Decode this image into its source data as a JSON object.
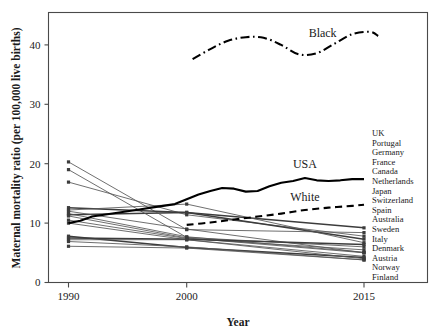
{
  "chart_data": {
    "type": "line",
    "title": "",
    "xlabel": "Year",
    "ylabel": "Maternal mortality ratio (per 100,000 live births)",
    "xlim": [
      1988.5,
      2017.0
    ],
    "ylim": [
      0,
      44.5
    ],
    "xticks": [
      1990,
      2000,
      2015
    ],
    "xticklabels": [
      "1990",
      "2000",
      "2015"
    ],
    "yticks": [
      0,
      10,
      20,
      30,
      40
    ],
    "yticklabels": [
      "0",
      "10",
      "20",
      "30",
      "40"
    ],
    "grid": false,
    "legend_position": "inline-annotations",
    "annotations": [
      {
        "text": "Black",
        "x": 2011.5,
        "y": 41.3
      },
      {
        "text": "USA",
        "x": 2010.0,
        "y": 19.2
      },
      {
        "text": "White",
        "x": 2010.0,
        "y": 13.7
      }
    ],
    "highlight_series": [
      {
        "name": "Black",
        "style": "dash-dot",
        "color": "#000000",
        "x": [
          2000.5,
          2002.0,
          2003.5,
          2005.0,
          2006.5,
          2008.0,
          2009.5,
          2011.0,
          2012.5,
          2014.0,
          2015.5,
          2016.2
        ],
        "y": [
          37.6,
          39.3,
          40.7,
          41.3,
          41.2,
          40.0,
          38.4,
          38.6,
          40.2,
          41.8,
          42.2,
          41.5
        ]
      },
      {
        "name": "USA",
        "style": "solid",
        "color": "#000000",
        "x": [
          1990,
          1991,
          1992,
          1993,
          1994,
          1995,
          1996,
          1997,
          1998,
          1999,
          2000,
          2001,
          2002,
          2003,
          2004,
          2005,
          2006,
          2007,
          2008,
          2009,
          2010,
          2011,
          2012,
          2013,
          2014,
          2015
        ],
        "y": [
          10.0,
          10.4,
          11.1,
          11.4,
          11.7,
          12.0,
          12.3,
          12.6,
          12.9,
          13.2,
          14.0,
          14.8,
          15.4,
          15.9,
          15.8,
          15.3,
          15.4,
          16.2,
          16.8,
          17.1,
          17.6,
          17.2,
          17.1,
          17.2,
          17.4,
          17.4
        ]
      },
      {
        "name": "White",
        "style": "dashed",
        "color": "#000000",
        "x": [
          2000,
          2002,
          2004,
          2006,
          2008,
          2010,
          2012,
          2014,
          2015
        ],
        "y": [
          9.7,
          10.1,
          10.6,
          11.1,
          11.6,
          12.2,
          12.6,
          12.9,
          13.1
        ]
      }
    ],
    "countries": [
      {
        "name": "UK",
        "x": [
          1990,
          2000,
          2015
        ],
        "y": [
          11.4,
          11.8,
          9.2
        ],
        "emphasis": "thick"
      },
      {
        "name": "Portugal",
        "x": [
          1990,
          2000,
          2015
        ],
        "y": [
          20.3,
          8.9,
          8.4
        ],
        "emphasis": "normal"
      },
      {
        "name": "Germany",
        "x": [
          1990,
          2000,
          2015
        ],
        "y": [
          19.0,
          7.6,
          6.0
        ],
        "emphasis": "normal"
      },
      {
        "name": "France",
        "x": [
          1990,
          2000,
          2015
        ],
        "y": [
          16.9,
          11.4,
          7.8
        ],
        "emphasis": "normal"
      },
      {
        "name": "Canada",
        "x": [
          1990,
          2000,
          2015
        ],
        "y": [
          12.6,
          11.8,
          7.3
        ],
        "emphasis": "thick"
      },
      {
        "name": "Netherlands",
        "x": [
          1990,
          2000,
          2015
        ],
        "y": [
          12.2,
          13.2,
          6.7
        ],
        "emphasis": "normal"
      },
      {
        "name": "Japan",
        "x": [
          1990,
          2000,
          2015
        ],
        "y": [
          12.0,
          9.0,
          5.0
        ],
        "emphasis": "normal"
      },
      {
        "name": "Switzerland",
        "x": [
          1990,
          2000,
          2015
        ],
        "y": [
          11.6,
          7.7,
          5.1
        ],
        "emphasis": "normal"
      },
      {
        "name": "Spain",
        "x": [
          1990,
          2000,
          2015
        ],
        "y": [
          11.2,
          7.5,
          5.0
        ],
        "emphasis": "normal"
      },
      {
        "name": "Australia",
        "x": [
          1990,
          2000,
          2015
        ],
        "y": [
          10.5,
          7.4,
          5.5
        ],
        "emphasis": "normal"
      },
      {
        "name": "Sweden",
        "x": [
          1990,
          2000,
          2015
        ],
        "y": [
          10.0,
          7.2,
          4.4
        ],
        "emphasis": "normal"
      },
      {
        "name": "Italy",
        "x": [
          1990,
          2000,
          2015
        ],
        "y": [
          7.8,
          5.9,
          4.2
        ],
        "emphasis": "thick"
      },
      {
        "name": "Denmark",
        "x": [
          1990,
          2000,
          2015
        ],
        "y": [
          7.5,
          7.3,
          6.4
        ],
        "emphasis": "thick"
      },
      {
        "name": "Austria",
        "x": [
          1990,
          2000,
          2015
        ],
        "y": [
          7.2,
          7.2,
          4.0
        ],
        "emphasis": "normal"
      },
      {
        "name": "Norway",
        "x": [
          1990,
          2000,
          2015
        ],
        "y": [
          6.9,
          6.0,
          3.8
        ],
        "emphasis": "normal"
      },
      {
        "name": "Finland",
        "x": [
          1990,
          2000,
          2015
        ],
        "y": [
          6.1,
          5.8,
          3.8
        ],
        "emphasis": "normal"
      }
    ]
  },
  "country_list": {
    "labels": [
      "UK",
      "Portugal",
      "Germany",
      "France",
      "Canada",
      "Netherlands",
      "Japan",
      "Switzerland",
      "Spain",
      "Australia",
      "Sweden",
      "Italy",
      "Denmark",
      "Austria",
      "Norway",
      "Finland"
    ]
  },
  "colors": {
    "axis": "#4a4a4a",
    "text": "#1a1a1a",
    "country_line": "#555555",
    "highlight_line": "#000000"
  }
}
